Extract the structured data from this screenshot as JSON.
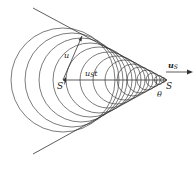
{
  "figure": {
    "colors": {
      "line": "#333333",
      "background": "#ffffff"
    },
    "apex": {
      "label": "S",
      "x": 167,
      "y": 80
    },
    "source_prev": {
      "label": "S'",
      "x": 63,
      "y": 80
    },
    "cone_lines": [
      {
        "x1": 33,
        "y1": 8,
        "x2": 167,
        "y2": 80
      },
      {
        "x1": 33,
        "y1": 154,
        "x2": 167,
        "y2": 80
      }
    ],
    "circles": [
      {
        "cx": 63,
        "r": 52
      },
      {
        "cx": 72,
        "r": 47
      },
      {
        "cx": 81,
        "r": 42
      },
      {
        "cx": 90,
        "r": 37
      },
      {
        "cx": 99,
        "r": 33
      },
      {
        "cx": 108,
        "r": 28
      },
      {
        "cx": 117,
        "r": 24
      },
      {
        "cx": 125,
        "r": 20
      },
      {
        "cx": 133,
        "r": 16
      },
      {
        "cx": 140,
        "r": 13
      },
      {
        "cx": 147,
        "r": 10
      },
      {
        "cx": 153,
        "r": 7
      },
      {
        "cx": 159,
        "r": 4.5
      },
      {
        "cx": 163,
        "r": 2.5
      }
    ],
    "labels": {
      "u_main": "u",
      "u_sub": "",
      "ust_main": "u",
      "ust_sub": "S",
      "ust_t": "t",
      "us_main": "u",
      "us_sub": "S",
      "S": "S",
      "S_prime": "S'",
      "theta": "θ"
    }
  }
}
